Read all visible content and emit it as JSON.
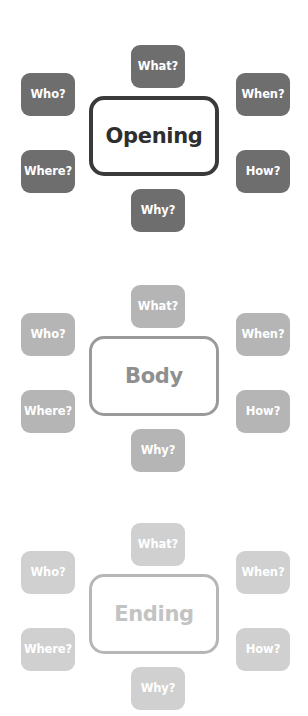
{
  "diagram": {
    "clusters": [
      {
        "name": "opening-cluster",
        "center_label": "Opening",
        "top": 0,
        "tag_color": "#6e6e6e",
        "border_color": "#3a3a3a",
        "border_width": "4px",
        "center_text_color": "#2e2e2e",
        "tags": [
          {
            "id": "what",
            "label": "What?",
            "position": "top"
          },
          {
            "id": "who",
            "label": "Who?",
            "position": "upper-left"
          },
          {
            "id": "when",
            "label": "When?",
            "position": "upper-right"
          },
          {
            "id": "where",
            "label": "Where?",
            "position": "lower-left"
          },
          {
            "id": "how",
            "label": "How?",
            "position": "lower-right"
          },
          {
            "id": "why",
            "label": "Why?",
            "position": "bottom"
          }
        ]
      },
      {
        "name": "body-cluster",
        "center_label": "Body",
        "top": 240,
        "tag_color": "#b5b5b5",
        "border_color": "#9a9a9a",
        "border_width": "3px",
        "center_text_color": "#8f8f8f",
        "tags": [
          {
            "id": "what",
            "label": "What?",
            "position": "top"
          },
          {
            "id": "who",
            "label": "Who?",
            "position": "upper-left"
          },
          {
            "id": "when",
            "label": "When?",
            "position": "upper-right"
          },
          {
            "id": "where",
            "label": "Where?",
            "position": "lower-left"
          },
          {
            "id": "how",
            "label": "How?",
            "position": "lower-right"
          },
          {
            "id": "why",
            "label": "Why?",
            "position": "bottom"
          }
        ]
      },
      {
        "name": "ending-cluster",
        "center_label": "Ending",
        "top": 478,
        "tag_color": "#d0d0d0",
        "border_color": "#b6b6b6",
        "border_width": "3px",
        "center_text_color": "#c3c3c3",
        "tags": [
          {
            "id": "what",
            "label": "What?",
            "position": "top"
          },
          {
            "id": "who",
            "label": "Who?",
            "position": "upper-left"
          },
          {
            "id": "when",
            "label": "When?",
            "position": "upper-right"
          },
          {
            "id": "where",
            "label": "Where?",
            "position": "lower-left"
          },
          {
            "id": "how",
            "label": "How?",
            "position": "lower-right"
          },
          {
            "id": "why",
            "label": "Why?",
            "position": "bottom"
          }
        ]
      }
    ]
  }
}
